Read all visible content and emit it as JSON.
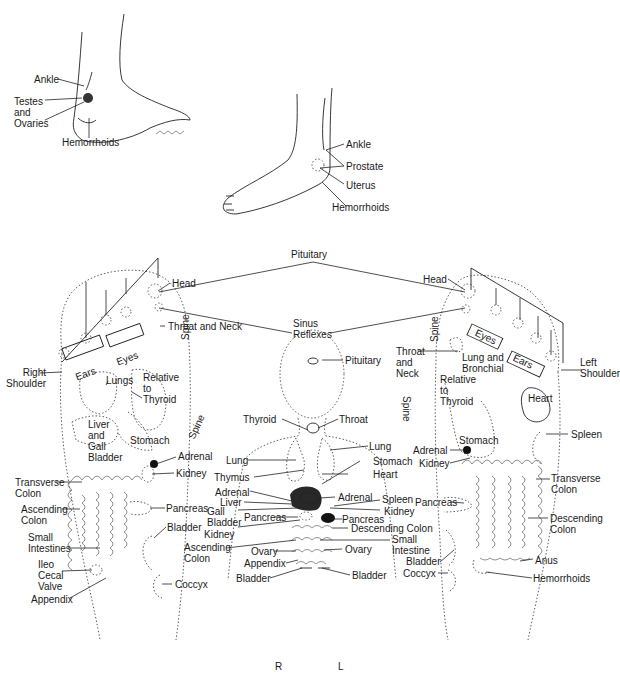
{
  "figure": {
    "orientation": {
      "right_label": "R",
      "left_label": "L"
    }
  },
  "inner_ankle": {
    "labels": [
      "Ankle",
      "Testes\nand\nOvaries",
      "Hemorrhoids"
    ]
  },
  "outer_ankle": {
    "labels": [
      "Ankle",
      "Prostate",
      "Uterus",
      "Hemorrhoids"
    ]
  },
  "top_shared": {
    "pituitary": "Pituitary",
    "sinus": "Sinus\nReflexes"
  },
  "right_sole": {
    "labels": {
      "head": "Head",
      "throat_neck": "Throat and Neck",
      "right_shoulder": "Right\nShoulder",
      "ears": "Ears",
      "eyes": "Eyes",
      "lungs": "Lungs",
      "relative_thyroid": "Relative\nto\nThyroid",
      "liver_gall": "Liver\nand\nGall\nBladder",
      "stomach": "Stomach",
      "spine_top": "Spine",
      "spine_mid": "Spine",
      "adrenal": "Adrenal",
      "kidney": "Kidney",
      "transverse_colon": "Transverse\nColon",
      "ascending_colon": "Ascending\nColon",
      "pancreas": "Pancreas",
      "bladder": "Bladder",
      "small_intestines": "Small\nIntestines",
      "ileo_cecal": "Ileo\nCecal\nValve",
      "appendix": "Appendix",
      "coccyx": "Coccyx"
    }
  },
  "body_center": {
    "labels": {
      "pituitary": "Pituitary",
      "thyroid": "Thyroid",
      "throat": "Throat",
      "lung_l": "Lung",
      "lung_r": "Lung",
      "thymus": "Thymus",
      "stomach": "Stomach",
      "heart": "Heart",
      "adrenal_l": "Adrenal",
      "liver": "Liver",
      "gall_bladder": "Gall\nBladder",
      "adrenal_r": "Adrenal",
      "spleen": "Spleen",
      "kidney_l": "Kidney",
      "kidney_r": "Kidney",
      "pancreas_l": "Pancreas",
      "pancreas_r": "Pancreas",
      "descending_colon": "Descending Colon",
      "ascending_colon": "Ascending\nColon",
      "small_intestine": "Small\nIntestine",
      "ovary_l": "Ovary",
      "ovary_r": "Ovary",
      "appendix": "Appendix",
      "bladder_l": "Bladder",
      "bladder_r": "Bladder"
    }
  },
  "left_sole": {
    "labels": {
      "head": "Head",
      "throat_neck": "Throat\nand\nNeck",
      "lung_bronchial": "Lung and\nBronchial",
      "eyes": "Eyes",
      "ears": "Ears",
      "left_shoulder": "Left\nShoulder",
      "relative_thyroid": "Relative\nto\nThyroid",
      "heart": "Heart",
      "spleen": "Spleen",
      "stomach": "Stomach",
      "spine_top": "Spine",
      "spine_mid": "Spine",
      "adrenal": "Adrenal",
      "kidney": "Kidney",
      "transverse_colon": "Transverse\nColon",
      "pancreas": "Pancreas",
      "descending_colon": "Descending\nColon",
      "bladder": "Bladder",
      "coccyx": "Coccyx",
      "anus": "Anus",
      "hemorrhoids": "Hemorrhoids"
    }
  }
}
